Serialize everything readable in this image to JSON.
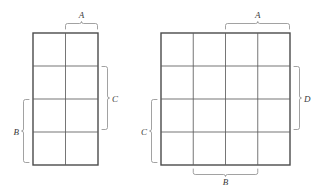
{
  "figure": {
    "background_color": "#ffffff",
    "grid_line_color": "#5d5d5d",
    "outline_color": "#4a4a4a",
    "brace_color": "#8a8a8a",
    "label_color": "#3a3a3a"
  },
  "maps": [
    {
      "id": "left-kmap",
      "name": "left-karnaugh-map",
      "columns": 2,
      "rows": 4,
      "bounds": {
        "x": 33,
        "y": 33,
        "width": 65,
        "height": 132
      },
      "col_lines": [
        33,
        65.5,
        98
      ],
      "row_lines": [
        33,
        66,
        99,
        132,
        165
      ],
      "braces": [
        {
          "id": "left-A",
          "name": "brace-A-top",
          "label": "A",
          "side": "top",
          "span_from": 65.5,
          "span_to": 98,
          "label_x": 81.5,
          "label_y": 15
        },
        {
          "id": "left-C",
          "name": "brace-C-right",
          "label": "C",
          "side": "right",
          "span_from": 66,
          "span_to": 132,
          "label_x": 115,
          "label_y": 102
        },
        {
          "id": "left-B",
          "name": "brace-B-left",
          "label": "B",
          "side": "left",
          "span_from": 99,
          "span_to": 165,
          "label_x": 17,
          "label_y": 135
        }
      ]
    },
    {
      "id": "right-kmap",
      "name": "right-karnaugh-map",
      "columns": 4,
      "rows": 4,
      "bounds": {
        "x": 161,
        "y": 33,
        "width": 129,
        "height": 132
      },
      "col_lines": [
        161,
        193.25,
        225.5,
        257.75,
        290
      ],
      "row_lines": [
        33,
        66,
        99,
        132,
        165
      ],
      "braces": [
        {
          "id": "right-A",
          "name": "brace-A-top",
          "label": "A",
          "side": "top",
          "span_from": 225.5,
          "span_to": 290,
          "label_x": 257.75,
          "label_y": 15
        },
        {
          "id": "right-D",
          "name": "brace-D-right",
          "label": "D",
          "side": "right",
          "span_from": 66,
          "span_to": 132,
          "label_x": 307,
          "label_y": 102
        },
        {
          "id": "right-C",
          "name": "brace-C-left",
          "label": "C",
          "side": "left",
          "span_from": 99,
          "span_to": 165,
          "label_x": 145,
          "label_y": 135
        },
        {
          "id": "right-B",
          "name": "brace-B-bottom",
          "label": "B",
          "side": "bottom",
          "span_from": 193.25,
          "span_to": 257.75,
          "label_x": 225.5,
          "label_y": 184
        }
      ]
    }
  ]
}
